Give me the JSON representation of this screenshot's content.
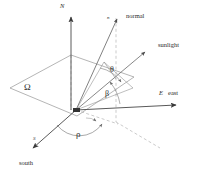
{
  "figure": {
    "type": "geometry-diagram",
    "background_color": "#ffffff",
    "line_color": "#595959",
    "dashed_color": "#9a9a9a",
    "text_color": "#2b2b2b"
  },
  "axes": [
    {
      "key": "north",
      "label": "N",
      "direction": "up",
      "style": "solid-arrow"
    },
    {
      "key": "east",
      "label": "east",
      "symbol": "E",
      "direction": "right",
      "style": "solid-arrow"
    },
    {
      "key": "south",
      "label": "south",
      "symbol": "S",
      "direction": "down-left",
      "style": "solid-arrow"
    }
  ],
  "vectors": [
    {
      "key": "normal",
      "label": "normal",
      "symbol": "n",
      "style": "solid-arrow"
    },
    {
      "key": "sunlight",
      "label": "sunlight",
      "symbol": "",
      "style": "solid-arrow"
    }
  ],
  "angles": [
    {
      "key": "theta",
      "symbol": "θ",
      "between": "normal-and-sunlight"
    },
    {
      "key": "beta",
      "symbol": "β",
      "between": "sunlight-and-east-horizon"
    },
    {
      "key": "rho",
      "symbol": "ρ",
      "between": "south-and-projection"
    }
  ],
  "regions": [
    {
      "key": "plane",
      "symbol": "Ω",
      "description": "tilted surface parallelogram"
    }
  ],
  "labels": {
    "north": "N",
    "east": "east",
    "east_axis": "E",
    "south": "south",
    "normal": "normal",
    "normal_symbol": "n",
    "sunlight": "sunlight",
    "omega": "Ω",
    "theta": "θ",
    "beta": "β",
    "rho": "ρ",
    "south_axis": "S"
  }
}
